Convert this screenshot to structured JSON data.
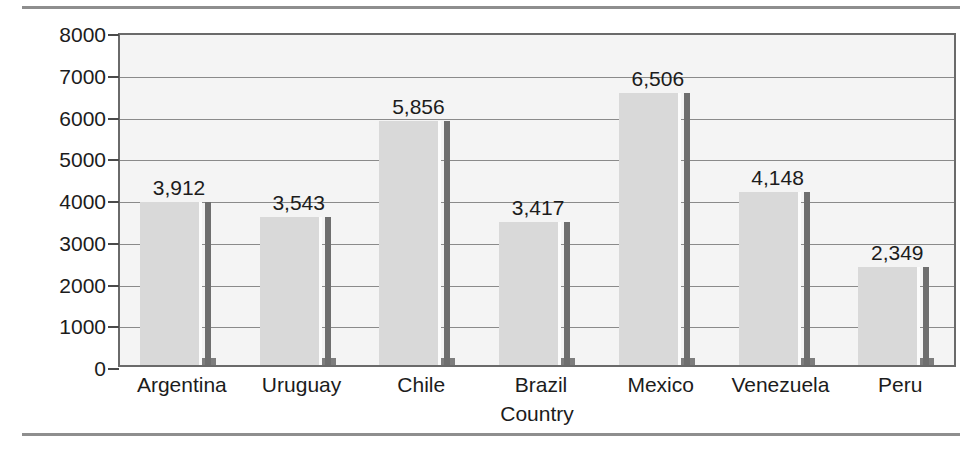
{
  "chart_data": {
    "type": "bar",
    "title": "",
    "xlabel": "Country",
    "ylabel": "US$",
    "categories": [
      "Argentina",
      "Uruguay",
      "Chile",
      "Brazil",
      "Mexico",
      "Venezuela",
      "Peru"
    ],
    "values": [
      3912,
      3543,
      5856,
      3417,
      6506,
      4148,
      2349
    ],
    "value_labels": [
      "3,912",
      "3,543",
      "5,856",
      "3,417",
      "6,506",
      "4,148",
      "2,349"
    ],
    "ylim": [
      0,
      8000
    ],
    "ytick_labels": [
      "8000",
      "7000",
      "6000",
      "5000",
      "4000",
      "3000",
      "2000",
      "1000",
      "0"
    ],
    "ytick_values": [
      8000,
      7000,
      6000,
      5000,
      4000,
      3000,
      2000,
      1000,
      0
    ],
    "grid": true,
    "legend": "none",
    "colors": {
      "bar_face": "#d9d9d9",
      "bar_side": "#6e6e6e",
      "plot_background": "#f4f4f4",
      "frame": "#6a6a6a",
      "gridline": "#8a8a8a",
      "text": "#1c1c1c",
      "rule": "#8e8e8e"
    }
  }
}
